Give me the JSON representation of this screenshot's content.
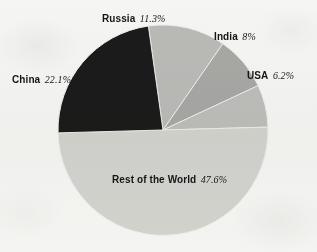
{
  "figure": {
    "background_color": "#f8f8f7",
    "text_color": "#161616"
  },
  "chart_data": {
    "type": "pie",
    "title": "",
    "subtitle": "",
    "xlabel": "",
    "ylabel": "",
    "grid": false,
    "legend_position": "none",
    "labels_position": "outside-callout",
    "unit": "%",
    "center_px": [
      163,
      130
    ],
    "radius_px": 105,
    "start_angle_deg": -8,
    "direction": "clockwise",
    "categories": [
      "Russia",
      "India",
      "USA",
      "Rest of the World",
      "China"
    ],
    "values": [
      11.3,
      8,
      6.2,
      47.6,
      22.1
    ],
    "slices": [
      {
        "name": "Russia",
        "value": 11.3,
        "value_text": "11.3%",
        "color": "#bcbcba",
        "label_name": "Russia",
        "label_pct": "11.3%"
      },
      {
        "name": "India",
        "value": 8,
        "value_text": "8%",
        "color": "#a9a9a7",
        "label_name": "India",
        "label_pct": "8%"
      },
      {
        "name": "USA",
        "value": 6.2,
        "value_text": "6.2%",
        "color": "#bfbfbd",
        "label_name": "USA",
        "label_pct": "6.2%"
      },
      {
        "name": "Rest of the World",
        "value": 47.6,
        "value_text": "47.6%",
        "color": "#d5d5d2",
        "label_name": "Rest of the World",
        "label_pct": "47.6%"
      },
      {
        "name": "China",
        "value": 22.1,
        "value_text": "22.1%",
        "color": "#1b1b1b",
        "label_name": "China",
        "label_pct": "22.1%"
      }
    ]
  }
}
